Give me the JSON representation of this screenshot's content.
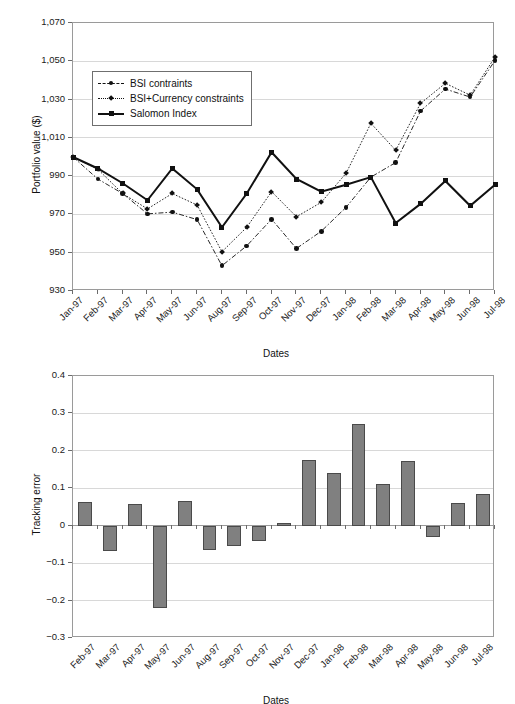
{
  "figure": {
    "background": "#ffffff",
    "bar_color": "#808080",
    "bar_border_color": "#4a4a4a",
    "line_color": "#111111",
    "grid_color": "#d8d8d8"
  },
  "chart_data": [
    {
      "id": "portfolio-value",
      "type": "line",
      "title": "",
      "xlabel": "Dates",
      "ylabel": "Portfolio value ($)",
      "ylim": [
        930,
        1070
      ],
      "yticks": [
        930,
        950,
        970,
        990,
        1010,
        1030,
        1050,
        1070
      ],
      "ytick_labels": [
        "930",
        "950",
        "970",
        "990",
        "1,010",
        "1,030",
        "1,050",
        "1,070"
      ],
      "grid": true,
      "legend_position": "upper-left-inside",
      "categories": [
        "Jan-97",
        "Feb-97",
        "Mar-97",
        "Apr-97",
        "May-97",
        "Jun-97",
        "Aug-97",
        "Sep-97",
        "Oct-97",
        "Nov-97",
        "Dec-97",
        "Jan-98",
        "Feb-98",
        "Mar-98",
        "Apr-98",
        "May-98",
        "Jun-98",
        "Jul-98"
      ],
      "series": [
        {
          "name": "BSI contraints",
          "marker": "circle",
          "linestyle": "dashdot",
          "values": [
            1000.0,
            988.5,
            980.9,
            970.3,
            971.2,
            967.3,
            943.2,
            953.6,
            967.5,
            952.2,
            961.2,
            973.7,
            989.5,
            997.1,
            1024.0,
            1035.5,
            1031.3,
            1050.4
          ]
        },
        {
          "name": "BSI+Currency constraints",
          "marker": "diamond",
          "linestyle": "dotted",
          "values": [
            1000.0,
            993.6,
            980.9,
            972.9,
            980.9,
            974.9,
            950.5,
            963.3,
            981.9,
            968.8,
            976.3,
            991.5,
            1017.6,
            1003.5,
            1028.0,
            1038.5,
            1032.3,
            1052.2
          ]
        },
        {
          "name": "Salomon Index",
          "marker": "square",
          "linestyle": "solid",
          "values": [
            1000.0,
            994.0,
            986.3,
            977.4,
            994.0,
            983.1,
            963.3,
            980.9,
            1002.5,
            988.5,
            981.9,
            985.5,
            989.5,
            965.5,
            975.5,
            987.5,
            974.5,
            985.5
          ]
        }
      ]
    },
    {
      "id": "tracking-error",
      "type": "bar",
      "title": "",
      "xlabel": "Dates",
      "ylabel": "Tracking error",
      "ylim": [
        -0.3,
        0.4
      ],
      "yticks": [
        -0.3,
        -0.2,
        -0.1,
        0,
        0.1,
        0.2,
        0.3,
        0.4
      ],
      "ytick_labels": [
        "−0.3",
        "−0.2",
        "−0.1",
        "0",
        "0.1",
        "0.2",
        "0.3",
        "0.4"
      ],
      "grid": true,
      "categories": [
        "Feb-97",
        "Mar-97",
        "Apr-97",
        "May-97",
        "Jun-97",
        "Aug-97",
        "Sep-97",
        "Oct-97",
        "Nov-97",
        "Dec-97",
        "Jan-98",
        "Feb-98",
        "Mar-98",
        "Apr-98",
        "May-98",
        "Jun-98",
        "Jul-98"
      ],
      "values": [
        0.063,
        -0.068,
        0.059,
        -0.221,
        0.065,
        -0.066,
        -0.055,
        -0.041,
        0.006,
        0.176,
        0.14,
        0.272,
        0.111,
        0.173,
        -0.029,
        0.061,
        0.084
      ]
    }
  ]
}
